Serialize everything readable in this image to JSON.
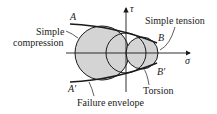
{
  "diagram": {
    "type": "Mohr circles with failure envelope",
    "axes": {
      "horizontal_label": "σ",
      "vertical_label": "τ"
    },
    "points": {
      "A": "A",
      "A_prime": "A′",
      "B": "B",
      "B_prime": "B′"
    },
    "annotations": {
      "simple_compression_line1": "Simple",
      "simple_compression_line2": "compression",
      "simple_tension": "Simple tension",
      "torsion": "Torsion",
      "failure_envelope": "Failure envelope"
    },
    "circles": [
      {
        "name": "simple-compression",
        "cx": 102,
        "cy": 53,
        "r": 27
      },
      {
        "name": "torsion",
        "cx": 126,
        "cy": 53,
        "r": 20
      },
      {
        "name": "simple-tension",
        "cx": 142,
        "cy": 53,
        "r": 16
      }
    ],
    "colors": {
      "fill": "#d4d4d4",
      "stroke": "#1a1a1a"
    }
  }
}
